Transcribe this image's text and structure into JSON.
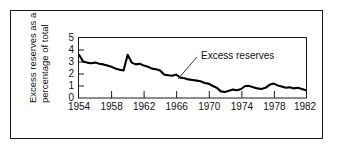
{
  "figure": {
    "background_color": "#ffffff",
    "frame_color": "#1a1a1a",
    "line_color": "#000000"
  },
  "chart_data": {
    "type": "line",
    "title": "",
    "subtitle": "",
    "xlabel": "",
    "ylabel": "Excess reserves as a percentage of total",
    "ylabel_line1": "Excess reserves as a",
    "ylabel_line2": "percentage of total",
    "xlim": [
      1954,
      1982
    ],
    "ylim": [
      0,
      5
    ],
    "grid": false,
    "legend_position": "none",
    "y_ticks": [
      0,
      1,
      2,
      3,
      4,
      5
    ],
    "y_tick_labels": [
      "0",
      "1",
      "2",
      "3",
      "4",
      "5"
    ],
    "x_ticks": [
      1954,
      1958,
      1962,
      1966,
      1970,
      1974,
      1978,
      1982
    ],
    "x_tick_labels": [
      "1954",
      "1958",
      "1962",
      "1966",
      "1970",
      "1974",
      "1978",
      "1982"
    ],
    "annotations": [
      {
        "text": "Excess reserves",
        "points_to_x": 1964.0,
        "points_to_y": 1.95
      }
    ],
    "series": [
      {
        "name": "Excess reserves",
        "color": "#000000",
        "x": [
          1954.0,
          1954.5,
          1955.0,
          1955.5,
          1956.0,
          1956.5,
          1957.0,
          1957.5,
          1958.0,
          1958.5,
          1959.0,
          1959.5,
          1960.0,
          1960.5,
          1961.0,
          1961.5,
          1962.0,
          1962.5,
          1963.0,
          1963.5,
          1964.0,
          1964.5,
          1965.0,
          1965.5,
          1966.0,
          1966.5,
          1967.0,
          1967.5,
          1968.0,
          1968.5,
          1969.0,
          1969.5,
          1970.0,
          1970.5,
          1971.0,
          1971.5,
          1972.0,
          1972.5,
          1973.0,
          1973.5,
          1974.0,
          1974.5,
          1975.0,
          1975.5,
          1976.0,
          1976.5,
          1977.0,
          1977.5,
          1978.0,
          1978.5,
          1979.0,
          1979.5,
          1980.0,
          1980.5,
          1981.0,
          1981.5,
          1982.0
        ],
        "y": [
          3.6,
          3.05,
          2.95,
          2.9,
          2.95,
          2.85,
          2.8,
          2.7,
          2.6,
          2.45,
          2.35,
          2.3,
          3.6,
          2.95,
          2.8,
          2.85,
          2.7,
          2.6,
          2.45,
          2.4,
          2.3,
          1.95,
          1.9,
          1.85,
          1.95,
          1.7,
          1.65,
          1.55,
          1.5,
          1.45,
          1.4,
          1.25,
          1.2,
          1.0,
          0.85,
          0.55,
          0.5,
          0.6,
          0.7,
          0.65,
          0.75,
          1.0,
          1.0,
          0.9,
          0.8,
          0.75,
          0.85,
          1.1,
          1.2,
          1.05,
          0.95,
          0.85,
          0.9,
          0.8,
          0.85,
          0.75,
          0.65
        ]
      }
    ]
  }
}
